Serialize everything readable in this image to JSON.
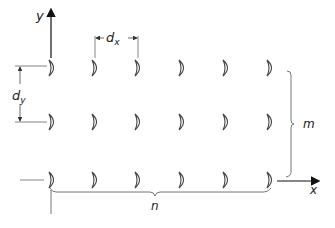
{
  "diagram": {
    "axes": {
      "x_label": "x",
      "y_label": "y"
    },
    "spacing": {
      "dx_label": "d",
      "dx_sub": "x",
      "dy_label": "d",
      "dy_sub": "y"
    },
    "counts": {
      "rows_label": "m",
      "cols_label": "n",
      "rows": 3,
      "cols": 6
    },
    "element_shape": "crescent",
    "colors": {
      "line": "#444444",
      "background": "#ffffff"
    }
  }
}
